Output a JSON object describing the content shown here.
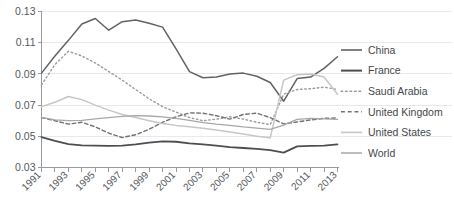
{
  "chart_data": {
    "type": "line",
    "title": "",
    "xlabel": "",
    "ylabel": "",
    "xlim": [
      1991,
      2013
    ],
    "ylim": [
      0.03,
      0.13
    ],
    "grid": true,
    "legend_position": "right",
    "x": [
      1991,
      1992,
      1993,
      1994,
      1995,
      1996,
      1997,
      1998,
      1999,
      2000,
      2001,
      2002,
      2003,
      2004,
      2005,
      2006,
      2007,
      2008,
      2009,
      2010,
      2011,
      2012,
      2013
    ],
    "ytick_labels": [
      "0.03",
      "0.05",
      "0.07",
      "0.09",
      "0.11",
      "0.13"
    ],
    "ytick_values": [
      0.03,
      0.05,
      0.07,
      0.09,
      0.11,
      0.13
    ],
    "xtick_labels": [
      "1991",
      "1993",
      "1995",
      "1997",
      "1999",
      "2001",
      "2003",
      "2005",
      "2007",
      "2009",
      "2011",
      "2013"
    ],
    "xtick_values": [
      1991,
      1993,
      1995,
      1997,
      1999,
      2001,
      2003,
      2005,
      2007,
      2009,
      2011,
      2013
    ],
    "series": [
      {
        "name": "China",
        "style": "solid",
        "color": "#5f6368",
        "width": 1.5,
        "values": [
          0.0905,
          0.1015,
          0.1115,
          0.122,
          0.1255,
          0.118,
          0.1235,
          0.1245,
          0.1225,
          0.12,
          0.106,
          0.0915,
          0.0875,
          0.088,
          0.09,
          0.0905,
          0.0885,
          0.0845,
          0.0725,
          0.087,
          0.088,
          0.0935,
          0.101
        ]
      },
      {
        "name": "France",
        "style": "solid",
        "color": "#4b4f53",
        "width": 1.8,
        "values": [
          0.0495,
          0.047,
          0.045,
          0.0442,
          0.044,
          0.0438,
          0.044,
          0.0448,
          0.046,
          0.0468,
          0.0465,
          0.0455,
          0.0448,
          0.044,
          0.043,
          0.0425,
          0.042,
          0.0412,
          0.0395,
          0.0435,
          0.0438,
          0.044,
          0.0448
        ]
      },
      {
        "name": "Saudi Arabia",
        "style": "dotted",
        "color": "#9b9b9b",
        "width": 1.4,
        "values": [
          0.083,
          0.096,
          0.1045,
          0.1015,
          0.097,
          0.0915,
          0.086,
          0.08,
          0.074,
          0.069,
          0.0655,
          0.062,
          0.06,
          0.061,
          0.0625,
          0.061,
          0.059,
          0.0575,
          0.077,
          0.08,
          0.0805,
          0.0815,
          0.08
        ]
      },
      {
        "name": "United Kingdom",
        "style": "dashed",
        "color": "#6e7276",
        "width": 1.4,
        "values": [
          0.062,
          0.06,
          0.0578,
          0.059,
          0.056,
          0.052,
          0.0492,
          0.051,
          0.0545,
          0.059,
          0.0625,
          0.065,
          0.0648,
          0.0632,
          0.061,
          0.064,
          0.0648,
          0.062,
          0.058,
          0.0592,
          0.0605,
          0.0615,
          0.0618
        ]
      },
      {
        "name": "United States",
        "style": "solid",
        "color": "#c6c6c6",
        "width": 1.5,
        "values": [
          0.069,
          0.0718,
          0.0755,
          0.0735,
          0.07,
          0.0668,
          0.064,
          0.062,
          0.06,
          0.0582,
          0.057,
          0.0562,
          0.0552,
          0.054,
          0.0528,
          0.0515,
          0.05,
          0.049,
          0.086,
          0.0895,
          0.09,
          0.088,
          0.077
        ]
      },
      {
        "name": "World",
        "style": "solid",
        "color": "#a4a8ab",
        "width": 1.3,
        "values": [
          0.0622,
          0.0605,
          0.06,
          0.0602,
          0.0612,
          0.062,
          0.0628,
          0.0632,
          0.063,
          0.0625,
          0.0615,
          0.0602,
          0.0588,
          0.0578,
          0.057,
          0.056,
          0.0552,
          0.0545,
          0.0572,
          0.0608,
          0.0615,
          0.0612,
          0.0608
        ]
      }
    ],
    "legend_entries": [
      {
        "label": "China",
        "style": "solid",
        "color": "#5f6368",
        "width": 1.6
      },
      {
        "label": "France",
        "style": "solid",
        "color": "#4b4f53",
        "width": 2.0
      },
      {
        "label": "Saudi Arabia",
        "style": "dotted",
        "color": "#9b9b9b",
        "width": 1.5
      },
      {
        "label": "United Kingdom",
        "style": "dashed",
        "color": "#6e7276",
        "width": 1.5
      },
      {
        "label": "United States",
        "style": "solid",
        "color": "#c6c6c6",
        "width": 1.6
      },
      {
        "label": "World",
        "style": "solid",
        "color": "#a4a8ab",
        "width": 1.5
      }
    ]
  },
  "colors": {
    "background": "#ffffff",
    "gridline": "#e9e9e9",
    "axis": "#9a9a9a",
    "tick_text": "#54585c",
    "legend_text": "#44484c"
  }
}
